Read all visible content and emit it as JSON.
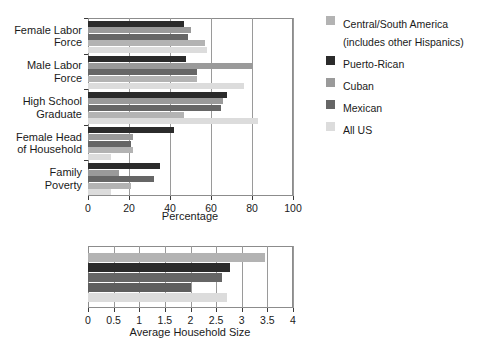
{
  "legend": {
    "position": "right",
    "items": [
      {
        "label": "Central/South America\n(includes other Hispanics)",
        "color": "#b3b3b3",
        "key": "central_south_america"
      },
      {
        "label": "Puerto-Rican",
        "color": "#2b2b2b",
        "key": "puerto_rican"
      },
      {
        "label": "Cuban",
        "color": "#9a9a9a",
        "key": "cuban"
      },
      {
        "label": "Mexican",
        "color": "#666666",
        "key": "mexican"
      },
      {
        "label": "All US",
        "color": "#dcdcdc",
        "key": "all_us"
      }
    ]
  },
  "chart_data": [
    {
      "type": "bar",
      "orientation": "horizontal",
      "id": "percentage-chart",
      "title": "",
      "xlabel": "Percentage",
      "ylabel": "",
      "xlim": [
        0,
        100
      ],
      "xticks": [
        0,
        20,
        40,
        60,
        80,
        100
      ],
      "xticklabels": [
        "0",
        "20",
        "40",
        "60",
        "80",
        "100"
      ],
      "grid": true,
      "categories": [
        "Female Labor\nForce",
        "Male Labor\nForce",
        "High School\nGraduate",
        "Female Head\nof Household",
        "Family\nPoverty"
      ],
      "series": [
        {
          "name": "Puerto-Rican",
          "color": "#2b2b2b",
          "values": [
            47,
            48,
            68,
            42,
            35
          ]
        },
        {
          "name": "Cuban",
          "color": "#9a9a9a",
          "values": [
            50,
            80,
            66,
            22,
            15
          ]
        },
        {
          "name": "Mexican",
          "color": "#666666",
          "values": [
            49,
            53,
            65,
            21,
            32
          ]
        },
        {
          "name": "Central/South America",
          "color": "#b3b3b3",
          "values": [
            57,
            53,
            47,
            22,
            21
          ]
        },
        {
          "name": "All US",
          "color": "#dcdcdc",
          "values": [
            58,
            76,
            83,
            11,
            11
          ]
        }
      ]
    },
    {
      "type": "bar",
      "orientation": "horizontal",
      "id": "household-size-chart",
      "title": "",
      "xlabel": "Average Household Size",
      "ylabel": "",
      "xlim": [
        0,
        4
      ],
      "xticks": [
        0,
        0.5,
        1,
        1.5,
        2,
        2.5,
        3,
        3.5,
        4
      ],
      "xticklabels": [
        "0",
        "0.5",
        "1",
        "1.5",
        "2",
        "2.5",
        "3",
        "3.5",
        "4"
      ],
      "grid": true,
      "categories": [
        ""
      ],
      "series": [
        {
          "name": "Central/South America",
          "color": "#b3b3b3",
          "values": [
            3.45
          ]
        },
        {
          "name": "Puerto-Rican",
          "color": "#2b2b2b",
          "values": [
            2.78
          ]
        },
        {
          "name": "Mexican",
          "color": "#666666",
          "values": [
            2.62
          ]
        },
        {
          "name": "Cuban",
          "color": "#5e5e5e",
          "values": [
            2.0
          ]
        },
        {
          "name": "All US",
          "color": "#dcdcdc",
          "values": [
            2.72
          ]
        }
      ]
    }
  ]
}
